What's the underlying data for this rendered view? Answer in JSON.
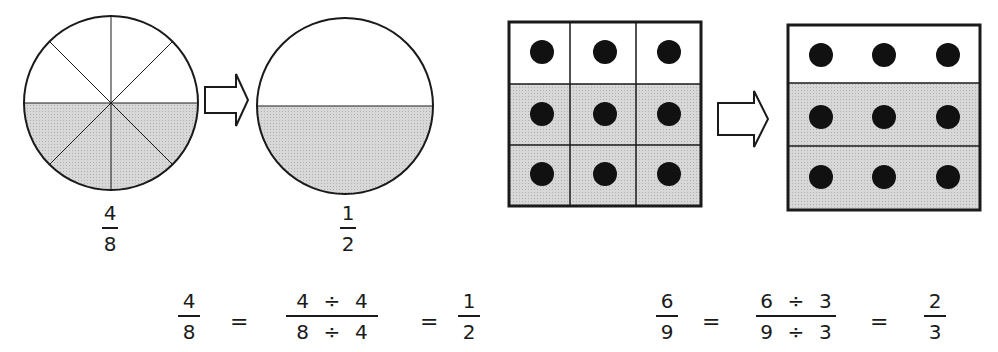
{
  "left_example": {
    "circle_before": {
      "parts": 8,
      "shaded": 4,
      "label": {
        "numerator": "4",
        "denominator": "8"
      }
    },
    "circle_after": {
      "parts": 2,
      "shaded": 1,
      "label": {
        "numerator": "1",
        "denominator": "2"
      }
    },
    "equation": {
      "lhs": {
        "numerator": "4",
        "denominator": "8"
      },
      "eq1": "=",
      "middle": {
        "num_a": "4",
        "num_op": "÷",
        "num_b": "4",
        "den_a": "8",
        "den_op": "÷",
        "den_b": "4"
      },
      "eq2": "=",
      "rhs": {
        "numerator": "1",
        "denominator": "2"
      }
    }
  },
  "right_example": {
    "grid_before": {
      "rows": 3,
      "cols": 3,
      "shaded_rows": 2,
      "dots": 9
    },
    "grid_after": {
      "rows": 3,
      "shaded_rows": 2,
      "dots": 9
    },
    "equation": {
      "lhs": {
        "numerator": "6",
        "denominator": "9"
      },
      "eq1": "=",
      "middle": {
        "num_a": "6",
        "num_op": "÷",
        "num_b": "3",
        "den_a": "9",
        "den_op": "÷",
        "den_b": "3"
      },
      "eq2": "=",
      "rhs": {
        "numerator": "2",
        "denominator": "3"
      }
    }
  },
  "colors": {
    "stroke": "#1a1a1a",
    "shade": "#d4d4d4",
    "dot": "#111111"
  }
}
